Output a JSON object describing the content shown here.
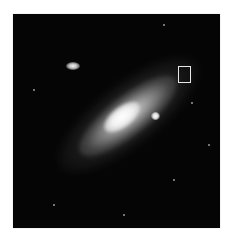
{
  "image": {
    "subject": "spiral galaxy with two companion galaxies",
    "background_color": "#050505",
    "marker": {
      "shape": "rectangle",
      "color": "#e8e8e8"
    },
    "objects": [
      {
        "name": "main-galaxy",
        "description": "bright elongated spiral galaxy, tilted diagonally"
      },
      {
        "name": "companion-upper-left",
        "description": "small elliptical companion galaxy"
      },
      {
        "name": "companion-right",
        "description": "compact bright companion near galaxy disk"
      }
    ]
  }
}
